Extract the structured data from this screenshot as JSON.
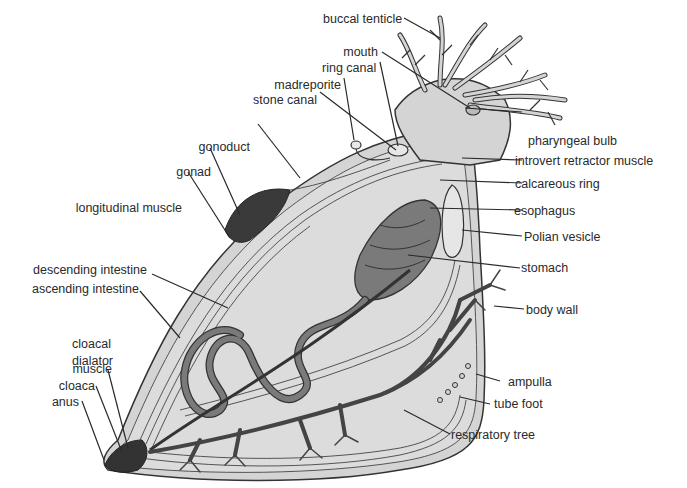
{
  "diagram": {
    "colors": {
      "background": "#ffffff",
      "body_fill": "#d9d9d9",
      "organ_dark": "#7a7a7a",
      "respiratory_tree": "#555555",
      "outline": "#333333",
      "text": "#2a2a2a"
    },
    "labels": {
      "buccal_tenticle": "buccal tenticle",
      "mouth": "mouth",
      "ring_canal": "ring canal",
      "madreporite": "madreporite",
      "stone_canal": "stone canal",
      "gonoduct": "gonoduct",
      "gonad": "gonad",
      "longitudinal_muscle": "longitudinal muscle",
      "descending_intestine": "descending intestine",
      "ascending_intestine": "ascending intestine",
      "cloacal_dialator_muscle_1": "cloacal",
      "cloacal_dialator_muscle_2": "dialator",
      "cloacal_dialator_muscle_3": "muscle",
      "cloaca": "cloaca",
      "anus": "anus",
      "pharyngeal_bulb": "pharyngeal bulb",
      "introvert_retractor_muscle": "introvert retractor muscle",
      "calcareous_ring": "calcareous ring",
      "esophagus": "esophagus",
      "polian_vesicle": "Polian vesicle",
      "stomach": "stomach",
      "body_wall": "body wall",
      "ampulla": "ampulla",
      "tube_foot": "tube foot",
      "respiratory_tree": "respiratory tree"
    }
  }
}
